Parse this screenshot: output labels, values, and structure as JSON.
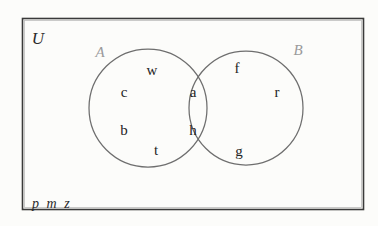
{
  "figure": {
    "type": "venn-diagram",
    "background_color": "#fcfcfa",
    "rect_border_color": "#3a3a3a",
    "circle_stroke_color": "#6e6e6e",
    "member_text_color": "#242424",
    "set_label_color": "#9a9a9a"
  },
  "universe": {
    "label": "U",
    "outside_members": [
      "p",
      "m",
      "z"
    ]
  },
  "sets": [
    {
      "key": "A",
      "label": "A",
      "only_members": [
        "w",
        "c",
        "b",
        "t"
      ]
    },
    {
      "key": "B",
      "label": "B",
      "only_members": [
        "f",
        "r",
        "g"
      ]
    }
  ],
  "intersection": {
    "label": "A and B",
    "members": [
      "a",
      "h"
    ]
  },
  "positions": {
    "rect": {
      "x": 22,
      "y": 18,
      "width": 341,
      "height": 191
    },
    "circle_a": {
      "cx": 148,
      "cy": 108,
      "r": 59
    },
    "circle_b": {
      "cx": 246,
      "cy": 108,
      "r": 57
    },
    "universe_label": {
      "x": 38,
      "y": 38
    },
    "label_a": {
      "x": 100,
      "y": 52
    },
    "label_b": {
      "x": 298,
      "y": 50
    },
    "outside_list": {
      "x": 32,
      "y": 196
    },
    "members": {
      "w": {
        "x": 152,
        "y": 70
      },
      "c": {
        "x": 124,
        "y": 92
      },
      "b": {
        "x": 124,
        "y": 130
      },
      "t": {
        "x": 156,
        "y": 150
      },
      "a": {
        "x": 193,
        "y": 92
      },
      "h": {
        "x": 193,
        "y": 130
      },
      "f": {
        "x": 237,
        "y": 68
      },
      "r": {
        "x": 277,
        "y": 92
      },
      "g": {
        "x": 239,
        "y": 151
      }
    }
  }
}
